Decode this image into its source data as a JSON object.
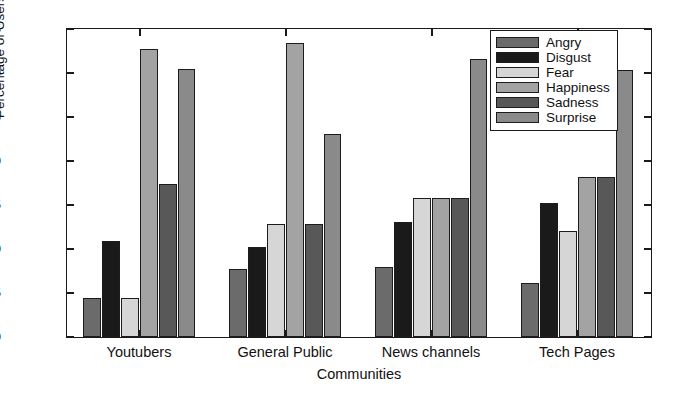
{
  "chart_data": {
    "type": "bar",
    "title": "",
    "xlabel": "Communities",
    "ylabel": "Percentage of Users",
    "categories": [
      "Youtubers",
      "General Public",
      "News channels",
      "Tech Pages"
    ],
    "ylim": [
      0,
      35
    ],
    "yticks": [
      0,
      5,
      10,
      15,
      20,
      25,
      30,
      35
    ],
    "ytick_labels": [
      "0",
      "5",
      "10",
      "15",
      "20",
      "25",
      "30",
      "35"
    ],
    "grid": false,
    "legend_position": "top-right",
    "series": [
      {
        "name": "Angry",
        "color": "#6b6b6b",
        "values": [
          4.4,
          7.7,
          7.9,
          6.1
        ]
      },
      {
        "name": "Disgust",
        "color": "#1a1a1a",
        "values": [
          10.9,
          10.2,
          13.1,
          15.2
        ]
      },
      {
        "name": "Fear",
        "color": "#d6d6d6",
        "values": [
          4.4,
          12.8,
          15.8,
          12.1
        ]
      },
      {
        "name": "Happiness",
        "color": "#a3a3a3",
        "values": [
          32.7,
          33.4,
          15.8,
          18.2
        ]
      },
      {
        "name": "Sadness",
        "color": "#585858",
        "values": [
          17.4,
          12.8,
          15.8,
          18.2
        ]
      },
      {
        "name": "Surprise",
        "color": "#8a8a8a",
        "values": [
          30.4,
          23.1,
          31.6,
          30.3
        ]
      }
    ]
  }
}
